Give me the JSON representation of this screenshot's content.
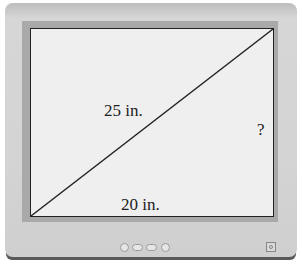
{
  "diagram": {
    "type": "right-triangle-on-monitor",
    "labels": {
      "diagonal": "25 in.",
      "base": "20 in.",
      "height": "?"
    },
    "colors": {
      "screen": "#efefef",
      "bezel": "#d4d4d4",
      "line": "#222222"
    }
  }
}
